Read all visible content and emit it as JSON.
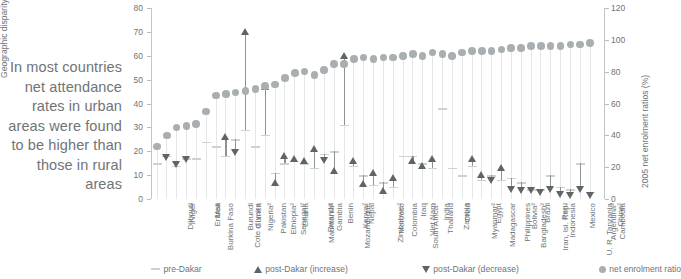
{
  "caption": "In most countries net attendance rates in urban areas were found to be higher than those in rural areas",
  "axes": {
    "left_title": "Geographic disparity",
    "right_title": "2005 net enrolment ratios (%)",
    "left_ticks": [
      "0",
      "10",
      "20",
      "30",
      "40",
      "50",
      "60",
      "70",
      "80"
    ],
    "right_ticks": [
      "0",
      "20",
      "40",
      "60",
      "80",
      "100",
      "120"
    ],
    "left_min": 0,
    "left_max": 80,
    "right_min": 0,
    "right_max": 120
  },
  "legend": [
    {
      "key": "pre",
      "label": "pre-Dakar",
      "marker": "line"
    },
    {
      "key": "up",
      "label": "post-Dakar (increase)",
      "marker": "triangle-up"
    },
    {
      "key": "dn",
      "label": "post-Dakar (decrease)",
      "marker": "triangle-down"
    },
    {
      "key": "ner",
      "label": "net enrolment ratio",
      "marker": "circle"
    }
  ],
  "chart_data": {
    "type": "scatter",
    "title": "",
    "xlabel": "",
    "ylabel": "Geographic disparity",
    "y2label": "2005 net enrolment ratios (%)",
    "ylim": [
      0,
      80
    ],
    "y2lim": [
      0,
      120
    ],
    "grid": false,
    "legend_position": "bottom",
    "series_names": [
      "pre-Dakar",
      "post-Dakar (increase)",
      "post-Dakar (decrease)",
      "net enrolment ratio"
    ],
    "categories": [
      "Djibouti",
      "Niger",
      "Burkina Faso",
      "Eritrea",
      "Mali",
      "Cote d'Ivoire",
      "Burundi",
      "Guinea",
      "Nigeria2",
      "Pakistan",
      "Ethiopia2",
      "Senegal2",
      "Ghana",
      "Mauritania2",
      "Rwanda",
      "Gambia",
      "Mozambique",
      "Benin",
      "Kenya2",
      "Nepal",
      "Zimbabwe2",
      "Morocco",
      "Colombia",
      "South Africa2",
      "Viet Nam",
      "Iraq",
      "Thailand",
      "India",
      "Zambia",
      "Chad",
      "Myanmar2",
      "Madagascar",
      "Egypt",
      "Philippines",
      "Bangladesh2",
      "Bolivia2",
      "Iran, Isl. Rep.",
      "Brazil",
      "Indonesia",
      "Peru",
      "U. R. Tanzania",
      "Mexico",
      "Argentina2",
      "Cambodia",
      "China2"
    ],
    "pre_dakar": [
      15,
      18,
      14,
      17,
      17,
      24,
      22,
      18,
      25,
      29,
      22,
      27,
      11,
      15,
      16,
      15,
      13,
      19,
      20,
      31,
      14,
      10,
      6,
      7,
      5,
      18,
      18,
      15,
      13,
      38,
      13,
      10,
      14,
      8,
      10,
      8,
      9,
      7,
      4,
      4,
      10,
      5,
      4,
      15,
      3
    ],
    "post_dakar": [
      null,
      17.5,
      14.5,
      16.5,
      null,
      null,
      null,
      26,
      19.5,
      70,
      null,
      47,
      7,
      18,
      17,
      16,
      21,
      16,
      12,
      60,
      16,
      6.5,
      11,
      3.5,
      9,
      null,
      16,
      14,
      17,
      null,
      null,
      null,
      17,
      10,
      7.5,
      13,
      4,
      3.5,
      3.5,
      2.5,
      4,
      2,
      1.5,
      4,
      1.5
    ],
    "post_dakar_direction": [
      null,
      "decrease",
      "decrease",
      "decrease",
      null,
      null,
      null,
      "increase",
      "decrease",
      "increase",
      null,
      "increase",
      "increase",
      "increase",
      "increase",
      "increase",
      "increase",
      "decrease",
      "increase",
      "increase",
      "increase",
      "increase",
      "increase",
      "increase",
      "increase",
      null,
      "increase",
      "increase",
      "increase",
      null,
      null,
      null,
      "increase",
      "increase",
      "decrease",
      "increase",
      "decrease",
      "decrease",
      "decrease",
      "decrease",
      "decrease",
      "decrease",
      "decrease",
      "decrease",
      "decrease"
    ],
    "net_enrolment_ratio": [
      33,
      40,
      45,
      46,
      47,
      55,
      65,
      66,
      67,
      68,
      69,
      71,
      72,
      76,
      79,
      80,
      78,
      81,
      85,
      85,
      88,
      89,
      88,
      89,
      89,
      90,
      91,
      90,
      92,
      91,
      90,
      92,
      93,
      93,
      93,
      94,
      95,
      95,
      96,
      96,
      96,
      96,
      97,
      97,
      98
    ]
  }
}
